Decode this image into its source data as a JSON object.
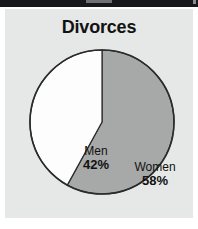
{
  "figure": {
    "title": "Divorces",
    "background_color": "#ffffff",
    "panel_color": "#e6e7e7",
    "top_band_color": "#16181a"
  },
  "chart_data": {
    "type": "pie",
    "title": "Divorces",
    "categories": [
      "Women",
      "Men"
    ],
    "values": [
      58,
      42
    ],
    "value_unit": "%",
    "labels": [
      {
        "name": "Women",
        "value": 58,
        "display_value": "58%",
        "color": "#a7a8a8"
      },
      {
        "name": "Men",
        "value": 42,
        "display_value": "42%",
        "color": "#fdfdfd"
      }
    ],
    "colors": [
      "#a7a8a8",
      "#fdfdfd"
    ],
    "start_angle_deg": 0,
    "direction": "clockwise",
    "legend": "none",
    "grid": false,
    "xlabel": "",
    "ylabel": ""
  },
  "icons": {
    "top_band_notch": "window-notch-icon",
    "top_band_tick": "window-tick-icon"
  }
}
